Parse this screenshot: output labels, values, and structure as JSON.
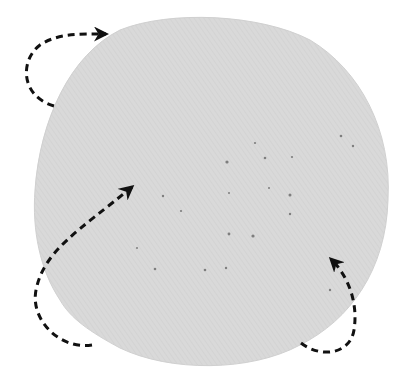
{
  "image": {
    "description": "Circular grey textured disc (fabric/paper sample) with dark speckles, annotated with three dashed curved arrows indicating rotation",
    "background_color": "#ffffff",
    "disc": {
      "fill_color": "#d8d8d8",
      "edge_color": "#cfcfcf",
      "speck_color": "#7a7a7a",
      "cx": 211,
      "cy": 205,
      "rx": 176,
      "ry": 172
    },
    "arrows": [
      {
        "name": "top-left-arrow",
        "color": "#111111",
        "direction": "clockwise"
      },
      {
        "name": "bottom-left-arrow",
        "color": "#111111",
        "direction": "up-right"
      },
      {
        "name": "bottom-right-arrow",
        "color": "#111111",
        "direction": "up-left"
      }
    ]
  }
}
